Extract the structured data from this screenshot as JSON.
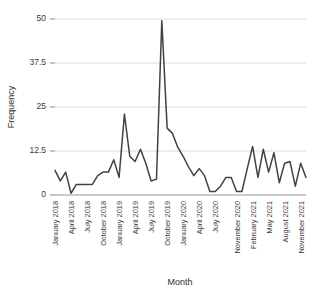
{
  "chart_data": {
    "type": "line",
    "title": "",
    "xlabel": "Month",
    "ylabel": "Frequency",
    "ylim": [
      0,
      50
    ],
    "yticks": [
      0,
      12.5,
      25,
      37.5,
      50
    ],
    "ytick_labels": [
      "0",
      "12.5",
      "25",
      "37.5",
      "50"
    ],
    "grid": true,
    "legend": false,
    "x": [
      "January 2018",
      "February 2018",
      "March 2018",
      "April 2018",
      "May 2018",
      "June 2018",
      "July 2018",
      "August 2018",
      "September 2018",
      "October 2018",
      "November 2018",
      "December 2018",
      "January 2019",
      "February 2019",
      "March 2019",
      "April 2019",
      "May 2019",
      "June 2019",
      "July 2019",
      "August 2019",
      "September 2019",
      "October 2019",
      "November 2019",
      "December 2019",
      "January 2020",
      "February 2020",
      "March 2020",
      "April 2020",
      "May 2020",
      "June 2020",
      "July 2020",
      "August 2020",
      "September 2020",
      "October 2020",
      "November 2020",
      "December 2020",
      "January 2021",
      "February 2021",
      "March 2021",
      "April 2021",
      "May 2021",
      "June 2021",
      "July 2021",
      "August 2021",
      "September 2021",
      "October 2021",
      "November 2021",
      "December 2021"
    ],
    "xtick_labels": [
      "January 2018",
      "April 2018",
      "July 2018",
      "October 2018",
      "January 2019",
      "April 2019",
      "July 2019",
      "October 2019",
      "January 2020",
      "April 2020",
      "July 2020",
      "November 2020",
      "February 2021",
      "May 2021",
      "August 2021",
      "November 2021"
    ],
    "xtick_indices": [
      0,
      3,
      6,
      9,
      12,
      15,
      18,
      21,
      24,
      27,
      30,
      34,
      37,
      40,
      43,
      46
    ],
    "values": [
      7.0,
      4.0,
      6.5,
      0.5,
      3.0,
      3.0,
      3.0,
      3.0,
      5.5,
      6.5,
      6.5,
      10.0,
      5.0,
      23.0,
      11.0,
      9.5,
      13.0,
      9.0,
      4.0,
      4.5,
      49.5,
      19.0,
      17.5,
      13.5,
      11.0,
      8.0,
      5.5,
      7.5,
      5.5,
      1.0,
      1.0,
      2.5,
      5.0,
      5.0,
      1.0,
      1.0,
      7.5,
      13.8,
      5.0,
      13.0,
      6.5,
      12.0,
      3.5,
      9.0,
      9.5,
      2.5,
      9.0,
      5.0
    ],
    "series_name": "Frequency",
    "line_color": "#414141",
    "grid_color": "#cfcfcf",
    "background": "#ffffff"
  },
  "axes": {
    "y_title": "Frequency",
    "x_title": "Month"
  }
}
